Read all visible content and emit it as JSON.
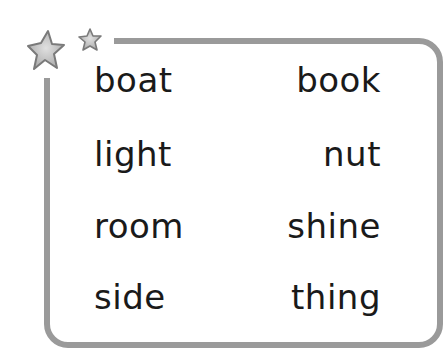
{
  "colors": {
    "border": "#9a9a9a",
    "star_fill": "#b8b8b8",
    "star_stroke": "#808080",
    "text": "#1a1a1a"
  },
  "decorations": {
    "stars": [
      "star-icon-large",
      "star-icon-small"
    ]
  },
  "words": {
    "left": [
      "boat",
      "light",
      "room",
      "side"
    ],
    "right": [
      "book",
      "nut",
      "shine",
      "thing"
    ]
  }
}
